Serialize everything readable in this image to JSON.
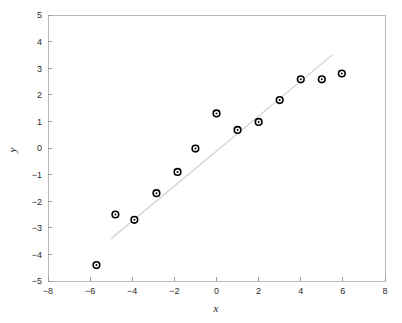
{
  "chart_data": {
    "type": "scatter",
    "title": "",
    "subtitle": "",
    "xlabel": "x",
    "ylabel": "y",
    "xlim": [
      -8,
      8
    ],
    "ylim": [
      -5,
      5
    ],
    "xticks": [
      -8,
      -6,
      -4,
      -2,
      0,
      2,
      4,
      6,
      8
    ],
    "xtick_labels": [
      "−8",
      "−6",
      "−4",
      "−2",
      "0",
      "2",
      "4",
      "6",
      "8"
    ],
    "yticks": [
      -5,
      -4,
      -3,
      -2,
      -1,
      0,
      1,
      2,
      3,
      4,
      5
    ],
    "ytick_labels": [
      "−5",
      "−4",
      "−3",
      "−2",
      "−1",
      "0",
      "1",
      "2",
      "3",
      "4",
      "5"
    ],
    "grid": false,
    "legend": null,
    "marker_style": "open-circle",
    "marker_color": "#000000",
    "marker_face_color": "#ffffff",
    "points": [
      {
        "x": -5.7,
        "y": -4.4
      },
      {
        "x": -4.8,
        "y": -2.5
      },
      {
        "x": -3.9,
        "y": -2.7
      },
      {
        "x": -2.85,
        "y": -1.7
      },
      {
        "x": -1.85,
        "y": -0.9
      },
      {
        "x": -1.0,
        "y": -0.02
      },
      {
        "x": 0.0,
        "y": 1.3
      },
      {
        "x": 1.0,
        "y": 0.68
      },
      {
        "x": 2.0,
        "y": 0.98
      },
      {
        "x": 3.0,
        "y": 1.8
      },
      {
        "x": 4.0,
        "y": 2.58
      },
      {
        "x": 5.0,
        "y": 2.58
      },
      {
        "x": 5.95,
        "y": 2.8
      }
    ],
    "series": [
      {
        "name": "data",
        "type": "scatter",
        "x": [
          -5.7,
          -4.8,
          -3.9,
          -2.85,
          -1.85,
          -1.0,
          0.0,
          1.0,
          2.0,
          3.0,
          4.0,
          5.0,
          5.95
        ],
        "values": [
          -4.4,
          -2.5,
          -2.7,
          -1.7,
          -0.9,
          -0.02,
          1.3,
          0.68,
          0.98,
          1.8,
          2.58,
          2.58,
          2.8
        ]
      },
      {
        "name": "fit-line",
        "type": "line",
        "color": "#cfcfcf",
        "x": [
          -5.0,
          5.5
        ],
        "values": [
          -3.4,
          3.5
        ]
      }
    ]
  },
  "axes": {
    "frame_color": "#b9b9b9",
    "tick_color": "#9a9a9a",
    "text_color": "#2b2b2b"
  },
  "figure": {
    "background": "#ffffff"
  }
}
